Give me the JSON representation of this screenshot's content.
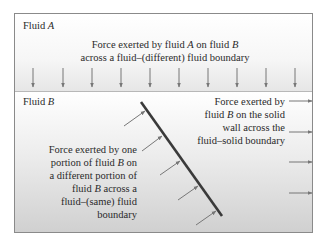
{
  "diagram": {
    "fluid_a_label": "Fluid",
    "fluid_a_var": "A",
    "fluid_b_label": "Fluid",
    "fluid_b_var": "B",
    "top_caption": {
      "line1_pre": "Force exerted by fluid ",
      "line1_var1": "A",
      "line1_mid": " on fluid ",
      "line1_var2": "B",
      "line2": "across a fluid–(different) fluid boundary"
    },
    "right_caption": {
      "line1": "Force exerted by",
      "line2_pre": "fluid ",
      "line2_var": "B",
      "line2_post": " on the solid",
      "line3": "wall across the",
      "line4": "fluid–solid boundary"
    },
    "left_caption": {
      "line1": "Force exerted by one",
      "line2_pre": "portion of fluid ",
      "line2_var": "B",
      "line2_post": " on",
      "line3": "a different portion of",
      "line4_pre": "fluid ",
      "line4_var": "B",
      "line4_post": " across a",
      "line5": "fluid–(same) fluid",
      "line6": "boundary"
    },
    "colors": {
      "arrow": "#777777",
      "wall": "#3a3a3a",
      "border": "#8a8a8a",
      "text": "#2a2a2a"
    },
    "down_arrows_count": 10,
    "right_arrows_count": 4,
    "wall_arrows_count": 5
  }
}
